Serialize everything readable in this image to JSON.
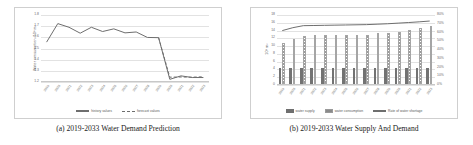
{
  "figure": {
    "background": "#ffffff",
    "border_color": "#cfcfcf",
    "grid_color": "#e2e2e2",
    "line_color": "#6e6e6e",
    "bar_supply_color": "#737373",
    "bar_consumption_color": "#9b9b9b"
  },
  "panels": [
    {
      "id": "a",
      "caption": "(a) 2019-2033 Water Demand Prediction",
      "ylabel": "Water consumption /10⁸ m³",
      "legend": [
        {
          "label": "history values",
          "style": "solid-line"
        },
        {
          "label": "forecast values",
          "style": "dashed-line"
        }
      ]
    },
    {
      "id": "b",
      "caption": "(b) 2019-2033 Water Supply And Demand",
      "ylabel": "10⁸ m³",
      "legend": [
        {
          "label": "water supply",
          "style": "bar-solid"
        },
        {
          "label": "water consumption",
          "style": "bar-hatched"
        },
        {
          "label": "Rate of water shortage",
          "style": "solid-line"
        }
      ]
    }
  ],
  "chart_data": [
    {
      "type": "line",
      "title": "(a) 2019-2033 Water Demand Prediction",
      "xlabel": "",
      "ylabel": "Water consumption /10⁸ m³",
      "ylim": [
        1.2,
        1.8
      ],
      "yticks": [
        "1.2",
        "1.3",
        "1.4",
        "1.5",
        "1.6",
        "1.7",
        "1.8"
      ],
      "grid": true,
      "legend_position": "bottom",
      "x": [
        "2019",
        "2020",
        "2021",
        "2022",
        "2023",
        "2024",
        "2025",
        "2026",
        "2027",
        "2028",
        "2029",
        "2030",
        "2031",
        "2032",
        "2033"
      ],
      "categories": [
        "2019",
        "2020",
        "2021",
        "2022",
        "2023",
        "2024",
        "2025",
        "2026",
        "2027",
        "2028",
        "2029",
        "2030",
        "2031",
        "2032",
        "2033"
      ],
      "series": [
        {
          "name": "history values",
          "style": "solid",
          "values": [
            1.557,
            1.723,
            1.69,
            1.637,
            1.69,
            1.652,
            1.676,
            1.64,
            1.648,
            1.599,
            1.597,
            1.224,
            1.255,
            1.24,
            1.24
          ]
        },
        {
          "name": "forecast values",
          "style": "dashed",
          "values": [
            null,
            null,
            null,
            null,
            null,
            null,
            null,
            null,
            null,
            null,
            null,
            1.243,
            1.245,
            1.243,
            1.247
          ]
        }
      ]
    },
    {
      "type": "bar",
      "title": "(b) 2019-2033 Water Supply And Demand",
      "xlabel": "",
      "ylabel": "10⁸ m³",
      "ylim": [
        0,
        18
      ],
      "yticks": [
        "0",
        "2",
        "4",
        "6",
        "8",
        "10",
        "12",
        "14",
        "16",
        "18"
      ],
      "y2label": "",
      "y2lim": [
        0,
        0.8
      ],
      "y2ticks": [
        "0%",
        "10%",
        "20%",
        "30%",
        "40%",
        "50%",
        "60%",
        "70%",
        "80%"
      ],
      "grid": true,
      "legend_position": "bottom",
      "categories": [
        "2019",
        "2020",
        "2021",
        "2022",
        "2023",
        "2024",
        "2025",
        "2026",
        "2027",
        "2028",
        "2029",
        "2030",
        "2031",
        "2032",
        "2033"
      ],
      "series": [
        {
          "name": "water supply",
          "axis": "left",
          "values": [
            4.0,
            4.0,
            4.0,
            4.0,
            4.0,
            4.0,
            4.0,
            4.0,
            4.0,
            4.0,
            4.0,
            4.0,
            4.0,
            4.0,
            4.0
          ]
        },
        {
          "name": "water consumption",
          "axis": "left",
          "values": [
            10.6,
            11.6,
            12.4,
            12.5,
            12.5,
            12.5,
            12.6,
            12.6,
            12.6,
            13.0,
            13.2,
            13.5,
            14.0,
            14.4,
            14.9
          ]
        },
        {
          "name": "Rate of water shortage",
          "axis": "right",
          "values": [
            0.622,
            0.655,
            0.678,
            0.68,
            0.682,
            0.684,
            0.686,
            0.688,
            0.69,
            0.695,
            0.7,
            0.707,
            0.714,
            0.722,
            0.731
          ]
        }
      ]
    }
  ]
}
